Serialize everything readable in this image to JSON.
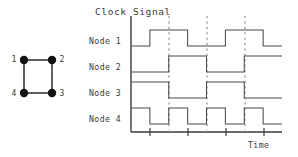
{
  "figure": {
    "title": "Clock Signal",
    "axis": {
      "x_label": "Time"
    },
    "row_labels": [
      "Node 1",
      "Node 2",
      "Node 3",
      "Node 4"
    ],
    "graph": {
      "node_labels": [
        "1",
        "2",
        "3",
        "4"
      ],
      "description": "square-graph-4-nodes"
    }
  },
  "chart_data": {
    "type": "line",
    "title": "Clock Signal",
    "xlabel": "Time",
    "ylabel": "",
    "grid": true,
    "legend_position": "left-row-labels",
    "xlim": [
      0,
      8
    ],
    "gridlines_x": [
      2,
      4,
      6
    ],
    "x_ticks": [
      1,
      3,
      5,
      7
    ],
    "series": [
      {
        "name": "Node 1",
        "levels": [
          0,
          1,
          1,
          0,
          0,
          1,
          1,
          0
        ],
        "x": [
          0,
          1,
          2,
          3,
          4,
          5,
          6,
          7,
          8
        ]
      },
      {
        "name": "Node 2",
        "levels": [
          0,
          0,
          1,
          1,
          0,
          0,
          1,
          1
        ],
        "x": [
          0,
          1,
          2,
          3,
          4,
          5,
          6,
          7,
          8
        ]
      },
      {
        "name": "Node 3",
        "levels": [
          1,
          1,
          0,
          0,
          1,
          1,
          0,
          0
        ],
        "x": [
          0,
          1,
          2,
          3,
          4,
          5,
          6,
          7,
          8
        ]
      },
      {
        "name": "Node 4",
        "levels": [
          1,
          0,
          1,
          0,
          1,
          0,
          1,
          0
        ],
        "x": [
          0,
          1,
          2,
          3,
          4,
          5,
          6,
          7,
          8
        ]
      }
    ]
  },
  "colors": {
    "waveform": "#4a4a4a",
    "gridline": "#6f6f6f",
    "axis": "#3a3a3a",
    "node_fill": "#111111",
    "background": "#ffffff"
  }
}
